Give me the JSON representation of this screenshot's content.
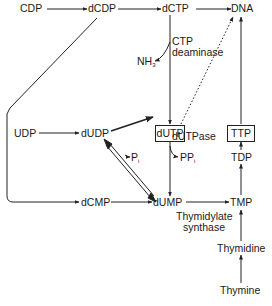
{
  "nodes": {
    "cdp": "CDP",
    "dcdp": "dCDP",
    "dctp": "dCTP",
    "dna": "DNA",
    "nh3": "NH",
    "nh3_sub": "3",
    "dutp": "dUTP",
    "ttp": "TTP",
    "udp": "UDP",
    "dudp": "dUDP",
    "pi": "P",
    "pi_sub": "i",
    "ppi": "PP",
    "ppi_sub": "i",
    "tdp": "TDP",
    "dcmp": "dCMP",
    "dump": "dUMP",
    "tmp": "TMP",
    "thymidine": "Thymidine",
    "thymine": "Thymine"
  },
  "enzymes": {
    "ctp_deaminase_line1": "CTP",
    "ctp_deaminase_line2": "deaminase",
    "dutpase": "dUTPase",
    "thymidylate_synthase_line1": "Thymidylate",
    "thymidylate_synthase_line2": "synthase"
  },
  "edges": [
    {
      "from": "CDP",
      "to": "dCDP",
      "style": "solid"
    },
    {
      "from": "dCDP",
      "to": "dCTP",
      "style": "solid"
    },
    {
      "from": "dCTP",
      "to": "DNA",
      "style": "solid"
    },
    {
      "from": "dCDP",
      "to": "dCMP",
      "style": "solid"
    },
    {
      "from": "dCTP",
      "to": "dUTP",
      "style": "solid",
      "enzyme": "CTP deaminase",
      "byproduct": "NH3"
    },
    {
      "from": "dUTP",
      "to": "DNA",
      "style": "dotted"
    },
    {
      "from": "UDP",
      "to": "dUDP",
      "style": "solid"
    },
    {
      "from": "dUDP",
      "to": "dUTP",
      "style": "solid"
    },
    {
      "from": "dUDP",
      "to": "dUMP",
      "style": "double",
      "byproduct": "Pi"
    },
    {
      "from": "dUTP",
      "to": "dUMP",
      "style": "solid",
      "enzyme": "dUTPase",
      "byproduct": "PPi"
    },
    {
      "from": "dCMP",
      "to": "dUMP",
      "style": "solid"
    },
    {
      "from": "dUMP",
      "to": "TMP",
      "style": "solid",
      "enzyme": "Thymidylate synthase"
    },
    {
      "from": "TMP",
      "to": "TDP",
      "style": "solid"
    },
    {
      "from": "TDP",
      "to": "TTP",
      "style": "solid"
    },
    {
      "from": "TTP",
      "to": "DNA",
      "style": "solid"
    },
    {
      "from": "Thymidine",
      "to": "TMP",
      "style": "solid"
    },
    {
      "from": "Thymine",
      "to": "Thymidine",
      "style": "solid"
    }
  ]
}
